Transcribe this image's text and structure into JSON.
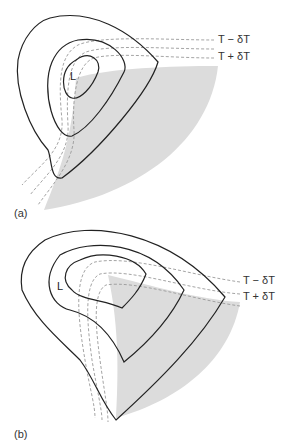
{
  "figure": {
    "panels": [
      {
        "id": "a",
        "label": "(a)",
        "low_label": "L",
        "isotherm_labels": [
          "T − δT",
          "T + δT"
        ]
      },
      {
        "id": "b",
        "label": "(b)",
        "low_label": "L",
        "isotherm_labels": [
          "T − δT",
          "T + δT"
        ]
      }
    ],
    "colors": {
      "isobar": "#222222",
      "isotherm": "#9a9a9a",
      "shading": "#dcdcdc"
    }
  }
}
